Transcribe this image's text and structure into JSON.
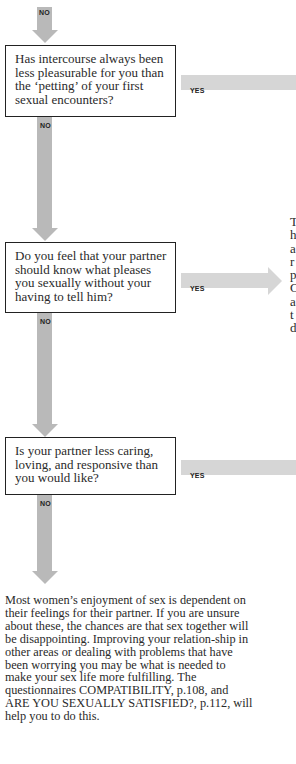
{
  "flowchart": {
    "top_tag": "NO",
    "questions": [
      {
        "text": "Has intercourse always been less pleasurable for you than the ‘petting’ of your first sexual encounters?",
        "yes_label": "YES",
        "no_label": "NO"
      },
      {
        "text": "Do you feel that your partner should know what pleases you sexually without your having to tell him?",
        "yes_label": "YES",
        "no_label": "NO"
      },
      {
        "text": "Is your partner less caring, loving, and responsive than you would like?",
        "yes_label": "YES",
        "no_label": "NO"
      }
    ],
    "side_text_clipped": "T\nh\na\nr\np\nC\na\nt\nd",
    "conclusion": "Most women’s enjoyment of sex is dependent on their feelings for their partner. If you are unsure about these, the chances are that sex together will be disappointing. Improving your relation-ship in other areas or dealing with problems that have been worrying you may be what is needed to make your sex life more fulfilling. The questionnaires COMPATIBILITY, p.108, and ARE YOU SEXUALLY SATISFIED?, p.112, will help you to do this."
  },
  "colors": {
    "connector_gray": "#b9b9b9",
    "yes_bar_gray": "#d6d6d6",
    "box_border": "#222222"
  }
}
